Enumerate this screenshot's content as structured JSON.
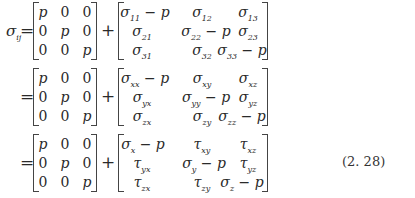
{
  "equation": {
    "lhs": {
      "symbol": "σ",
      "subscript": "ij"
    },
    "equals": "=",
    "plus": "+",
    "number": "(2. 28)",
    "pressure_matrix": [
      [
        "p",
        "0",
        "0"
      ],
      [
        "0",
        "p",
        "0"
      ],
      [
        "0",
        "0",
        "p"
      ]
    ],
    "rows": [
      {
        "deviator": [
          [
            {
              "s": "σ",
              "sub": "11",
              "tail": " − p"
            },
            {
              "s": "σ",
              "sub": "12",
              "tail": ""
            },
            {
              "s": "σ",
              "sub": "13",
              "tail": ""
            }
          ],
          [
            {
              "s": "σ",
              "sub": "21",
              "tail": ""
            },
            {
              "s": "σ",
              "sub": "22",
              "tail": " − p"
            },
            {
              "s": "σ",
              "sub": "23",
              "tail": ""
            }
          ],
          [
            {
              "s": "σ",
              "sub": "31",
              "tail": ""
            },
            {
              "s": "σ",
              "sub": "32",
              "tail": ""
            },
            {
              "s": "σ",
              "sub": "33",
              "tail": " − p"
            }
          ]
        ]
      },
      {
        "deviator": [
          [
            {
              "s": "σ",
              "sub": "xx",
              "tail": " − p"
            },
            {
              "s": "σ",
              "sub": "xy",
              "tail": ""
            },
            {
              "s": "σ",
              "sub": "xz",
              "tail": ""
            }
          ],
          [
            {
              "s": "σ",
              "sub": "yx",
              "tail": ""
            },
            {
              "s": "σ",
              "sub": "yy",
              "tail": " − p"
            },
            {
              "s": "σ",
              "sub": "yz",
              "tail": ""
            }
          ],
          [
            {
              "s": "σ",
              "sub": "zx",
              "tail": ""
            },
            {
              "s": "σ",
              "sub": "zy",
              "tail": ""
            },
            {
              "s": "σ",
              "sub": "zz",
              "tail": " − p"
            }
          ]
        ]
      },
      {
        "deviator": [
          [
            {
              "s": "σ",
              "sub": "x",
              "tail": " − p"
            },
            {
              "s": "τ",
              "sub": "xy",
              "tail": ""
            },
            {
              "s": "τ",
              "sub": "xz",
              "tail": ""
            }
          ],
          [
            {
              "s": "τ",
              "sub": "yx",
              "tail": ""
            },
            {
              "s": "σ",
              "sub": "y",
              "tail": " − p"
            },
            {
              "s": "τ",
              "sub": "yz",
              "tail": ""
            }
          ],
          [
            {
              "s": "τ",
              "sub": "zx",
              "tail": ""
            },
            {
              "s": "τ",
              "sub": "zy",
              "tail": ""
            },
            {
              "s": "σ",
              "sub": "z",
              "tail": " − p"
            }
          ]
        ]
      }
    ]
  }
}
